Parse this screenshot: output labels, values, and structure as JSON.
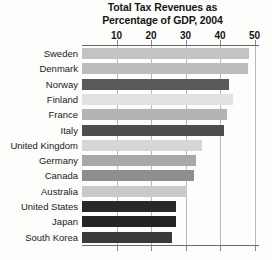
{
  "chart_data": {
    "type": "bar",
    "orientation": "horizontal",
    "title": "Total Tax Revenues as Percentage of GDP, 2004",
    "title_lines": [
      "Total Tax Revenues as",
      "Percentage of GDP, 2004"
    ],
    "xlabel": "",
    "ylabel": "",
    "xlim": [
      0,
      51
    ],
    "ticks": [
      10,
      20,
      30,
      40,
      50
    ],
    "tick_labels": [
      "10",
      "20",
      "30",
      "40",
      "50"
    ],
    "grid": true,
    "grid_axis": "x",
    "legend": false,
    "categories": [
      "Sweden",
      "Denmark",
      "Norway",
      "Finland",
      "France",
      "Italy",
      "United Kingdom",
      "Germany",
      "Canada",
      "Australia",
      "United States",
      "Japan",
      "South Korea"
    ],
    "values": [
      48.4,
      48.0,
      42.6,
      43.9,
      42.1,
      41.2,
      34.7,
      33.0,
      32.4,
      30.4,
      27.3,
      27.3,
      26.1
    ],
    "bar_colors": [
      "#c3c3c3",
      "#bcbcbc",
      "#595959",
      "#e2e2e2",
      "#b4b4b4",
      "#4e4e4e",
      "#d6d6d6",
      "#a8a8a8",
      "#8e8e8e",
      "#c9c9c9",
      "#282828",
      "#232323",
      "#3a3a3a"
    ]
  },
  "colors": {
    "background": "#fdfdfc",
    "text": "#151515",
    "gridline": "#b9b9b9",
    "axis": "#6a6a6a"
  }
}
